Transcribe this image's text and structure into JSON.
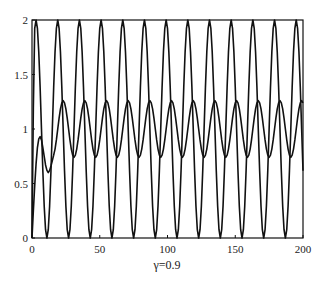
{
  "chart_data": {
    "type": "line",
    "title": "",
    "xlabel": "γ=0.9",
    "ylabel": "",
    "xlim": [
      0,
      200
    ],
    "ylim": [
      0,
      2
    ],
    "grid": false,
    "legend": null,
    "x_ticks": [
      0,
      50,
      100,
      150,
      200
    ],
    "y_ticks": [
      0,
      0.5,
      1,
      1.5,
      2
    ],
    "x_tick_labels": [
      "0",
      "50",
      "100",
      "150",
      "200"
    ],
    "y_tick_labels": [
      "0",
      "0.5",
      "1",
      "1.5",
      "2"
    ],
    "x_step": 1,
    "series": [
      {
        "name": "fast oscillation (0–2)",
        "color": "#111111",
        "values": [
          0,
          1.2,
          1.924,
          2.0,
          1.924,
          1.707,
          1.383,
          1.0,
          0.617,
          0.293,
          0.076,
          0,
          0.076,
          0.293,
          0.617,
          1.0,
          1.383,
          1.707,
          1.924,
          2.0,
          1.924,
          1.707,
          1.383,
          1.0,
          0.617,
          0.293,
          0.076,
          0,
          0.076,
          0.293,
          0.617,
          1.0,
          1.383,
          1.707,
          1.924,
          2.0,
          1.924,
          1.707,
          1.383,
          1.0,
          0.617,
          0.293,
          0.076,
          0,
          0.076,
          0.293,
          0.617,
          1.0,
          1.383,
          1.707,
          1.924,
          2.0,
          1.924,
          1.707,
          1.383,
          1.0,
          0.617,
          0.293,
          0.076,
          0,
          0.076,
          0.293,
          0.617,
          1.0,
          1.383,
          1.707,
          1.924,
          2.0,
          1.924,
          1.707,
          1.383,
          1.0,
          0.617,
          0.293,
          0.076,
          0,
          0.076,
          0.293,
          0.617,
          1.0,
          1.383,
          1.707,
          1.924,
          2.0,
          1.924,
          1.707,
          1.383,
          1.0,
          0.617,
          0.293,
          0.076,
          0,
          0.076,
          0.293,
          0.617,
          1.0,
          1.383,
          1.707,
          1.924,
          2.0,
          1.924,
          1.707,
          1.383,
          1.0,
          0.617,
          0.293,
          0.076,
          0,
          0.076,
          0.293,
          0.617,
          1.0,
          1.383,
          1.707,
          1.924,
          2.0,
          1.924,
          1.707,
          1.383,
          1.0,
          0.617,
          0.293,
          0.076,
          0,
          0.076,
          0.293,
          0.617,
          1.0,
          1.383,
          1.707,
          1.924,
          2.0,
          1.924,
          1.707,
          1.383,
          1.0,
          0.617,
          0.293,
          0.076,
          0,
          0.076,
          0.293,
          0.617,
          1.0,
          1.383,
          1.707,
          1.924,
          2.0,
          1.924,
          1.707,
          1.383,
          1.0,
          0.617,
          0.293,
          0.076,
          0,
          0.076,
          0.293,
          0.617,
          1.0,
          1.383,
          1.707,
          1.924,
          2.0,
          1.924,
          1.707,
          1.383,
          1.0,
          0.617,
          0.293,
          0.076,
          0,
          0.076,
          0.293,
          0.617,
          1.0,
          1.383,
          1.707,
          1.924,
          2.0,
          1.924,
          1.707,
          1.383,
          1.0,
          0.617,
          0.293,
          0.076,
          0,
          0.076,
          0.293,
          0.617,
          1.0,
          1.383,
          1.707,
          1.924,
          2.0,
          1.924,
          1.707,
          1.383,
          1.0,
          0.617
        ]
      },
      {
        "name": "slow oscillation (~0.74–1.26)",
        "color": "#111111",
        "values": [
          0,
          0.25,
          0.48,
          0.68,
          0.83,
          0.91,
          0.93,
          0.9,
          0.83,
          0.75,
          0.67,
          0.62,
          0.6,
          0.62,
          0.66,
          0.71,
          0.76,
          0.816,
          0.9,
          1.0,
          1.1,
          1.184,
          1.24,
          1.26,
          1.24,
          1.184,
          1.1,
          1.0,
          0.9,
          0.816,
          0.76,
          0.74,
          0.76,
          0.816,
          0.9,
          1.0,
          1.1,
          1.184,
          1.24,
          1.26,
          1.24,
          1.184,
          1.1,
          1.0,
          0.9,
          0.816,
          0.76,
          0.74,
          0.76,
          0.816,
          0.9,
          1.0,
          1.1,
          1.184,
          1.24,
          1.26,
          1.24,
          1.184,
          1.1,
          1.0,
          0.9,
          0.816,
          0.76,
          0.74,
          0.76,
          0.816,
          0.9,
          1.0,
          1.1,
          1.184,
          1.24,
          1.26,
          1.24,
          1.184,
          1.1,
          1.0,
          0.9,
          0.816,
          0.76,
          0.74,
          0.76,
          0.816,
          0.9,
          1.0,
          1.1,
          1.184,
          1.24,
          1.26,
          1.24,
          1.184,
          1.1,
          1.0,
          0.9,
          0.816,
          0.76,
          0.74,
          0.76,
          0.816,
          0.9,
          1.0,
          1.1,
          1.184,
          1.24,
          1.26,
          1.24,
          1.184,
          1.1,
          1.0,
          0.9,
          0.816,
          0.76,
          0.74,
          0.76,
          0.816,
          0.9,
          1.0,
          1.1,
          1.184,
          1.24,
          1.26,
          1.24,
          1.184,
          1.1,
          1.0,
          0.9,
          0.816,
          0.76,
          0.74,
          0.76,
          0.816,
          0.9,
          1.0,
          1.1,
          1.184,
          1.24,
          1.26,
          1.24,
          1.184,
          1.1,
          1.0,
          0.9,
          0.816,
          0.76,
          0.74,
          0.76,
          0.816,
          0.9,
          1.0,
          1.1,
          1.184,
          1.24,
          1.26,
          1.24,
          1.184,
          1.1,
          1.0,
          0.9,
          0.816,
          0.76,
          0.74,
          0.76,
          0.816,
          0.9,
          1.0,
          1.1,
          1.184,
          1.24,
          1.26,
          1.24,
          1.184,
          1.1,
          1.0,
          0.9,
          0.816,
          0.76,
          0.74,
          0.76,
          0.816,
          0.9,
          1.0,
          1.1,
          1.184,
          1.24,
          1.26,
          1.24,
          1.184,
          1.1,
          1.0,
          0.9,
          0.816,
          0.76,
          0.74,
          0.76,
          0.816,
          0.9,
          1.0,
          1.1,
          1.184,
          1.24,
          1.26,
          1.24
        ]
      }
    ]
  },
  "axes": {
    "xlabel": "γ=0.9"
  }
}
